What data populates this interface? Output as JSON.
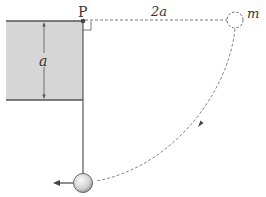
{
  "diagram": {
    "labels": {
      "pivot": "P",
      "block_height": "a",
      "horizontal_distance": "2a",
      "mass": "m"
    },
    "colors": {
      "block_fill": "#d6d6d6",
      "line": "#555555",
      "dashed": "#666666",
      "ball_light": "#f4f4f4",
      "ball_dark": "#9a9a9a"
    }
  }
}
